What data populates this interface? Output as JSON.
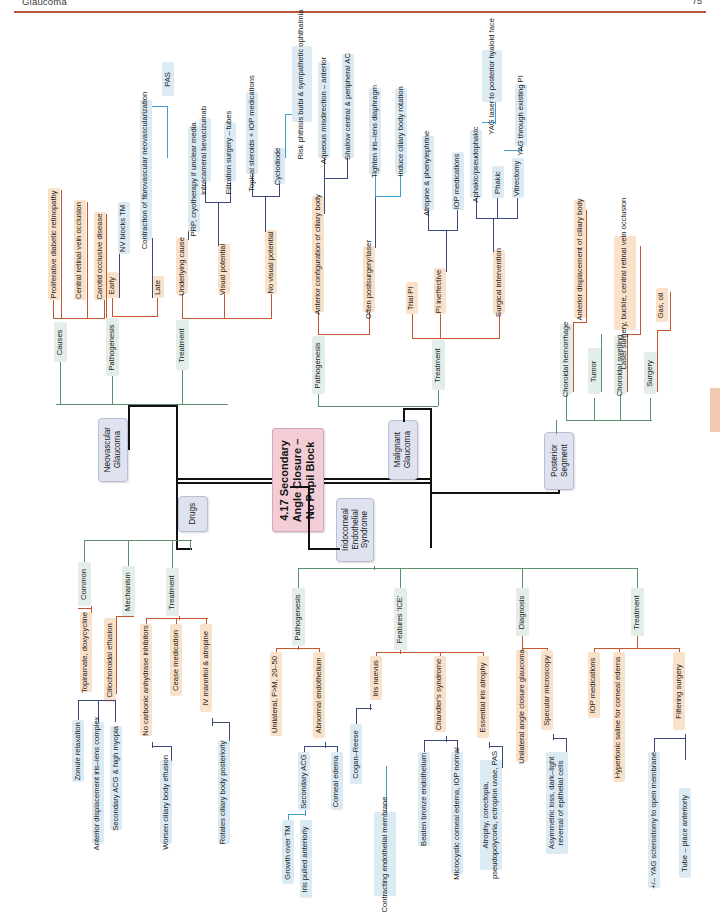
{
  "page": {
    "running_head": "Glaucoma",
    "page_number": "75"
  },
  "colors": {
    "center_fill": "#f3cdd6",
    "main_fill": "#dfe2ef",
    "green_fill": "#e2eee7",
    "orange_fill": "#fae2ca",
    "blue_fill": "#dceaf4",
    "rule": "#b8553c",
    "stroke_black": "#111111",
    "stroke_green": "#5c8f6e",
    "stroke_orange": "#c4552c",
    "stroke_navy": "#3b4a7a",
    "stroke_cyan": "#3e9fd0"
  },
  "center": {
    "title": "4.17 Secondary\nAngle Closure –\nNo Pupil Block"
  },
  "branches": {
    "neovascular": {
      "label": "Neovascular\nGlaucoma",
      "causes": {
        "label": "Causes",
        "items": [
          "Proliferative diabetic retinopathy",
          "Central retinal vein occlusion",
          "Carotid occlusive disease"
        ]
      },
      "pathogenesis": {
        "label": "Pathogenesis",
        "items": [
          {
            "label": "Early",
            "children": [
              "NV blocks TM"
            ]
          },
          {
            "label": "Late",
            "children": [
              "Contraction of fibrovascular neovascularization"
            ],
            "grandchildren": [
              "PAS"
            ]
          }
        ]
      },
      "treatment": {
        "label": "Treatment",
        "items": [
          {
            "label": "Underlying cause",
            "children": [
              "PRP, cryotherapy if unclear media"
            ]
          },
          {
            "label": "Visual potential",
            "children": [
              "Intracameral bevacizumab",
              "Filtration surgery – tubes"
            ]
          },
          {
            "label": "No visual potential",
            "children": [
              "Topical steroids + IOP medications",
              "Cyclodiode"
            ],
            "grandchildren": [
              "Risk phthisis bulbi & sympathetic ophthalmia"
            ]
          }
        ]
      }
    },
    "malignant": {
      "label": "Malignant\nGlaucoma",
      "pathogenesis": {
        "label": "Pathogenesis",
        "items": [
          {
            "label": "Anterior configuration of ciliary body",
            "children": [
              "Aqueous misdirection – anterior",
              "Shallow central & peripheral AC"
            ]
          },
          {
            "label": "Often postsurgery/laser",
            "children": [
              "Tighten iris–lens diaphragm",
              "Induce ciliary body rotation"
            ]
          }
        ]
      },
      "treatment": {
        "label": "Treatment",
        "items": [
          {
            "label": "Trial PI",
            "children": []
          },
          {
            "label": "PI ineffective",
            "children": [
              "Atropine & phenylephrine",
              "IOP medications"
            ]
          },
          {
            "label": "Surgical intervention",
            "children": [
              "Aphakic/pseudophakic",
              "Phakic",
              "Vitrectomy"
            ],
            "grandchildren": [
              "YAG laser to posterior hyaloid face",
              "YAG through existing PI"
            ]
          }
        ]
      }
    },
    "posterior": {
      "label": "Posterior\nSegment",
      "items": [
        {
          "label": "Choroidal hemorrhage",
          "children": [
            "Anterior displacement of ciliary body"
          ]
        },
        {
          "label": "Tumor",
          "children": []
        },
        {
          "label": "Choroidal swelling",
          "children": [
            "Laser surgery, buckle, central retinal vein occlusion"
          ]
        },
        {
          "label": "Surgery",
          "children": [
            "Gas, oil"
          ]
        }
      ]
    },
    "drugs": {
      "label": "Drugs",
      "common": {
        "label": "Common",
        "items": [
          "Topiramate, doxycycline"
        ]
      },
      "mechanism": {
        "label": "Mechanism",
        "items": [
          {
            "label": "Ciliochoroidal effusion",
            "children": [
              "Zonule relaxation",
              "Anterior displacement iris–lens complex",
              "Secondary ACG & high myopia"
            ]
          }
        ]
      },
      "treatment": {
        "label": "Treatment",
        "items": [
          {
            "label": "No carbonic anhydrase inhibitors",
            "children": [
              "Worsen ciliary body effusion"
            ]
          },
          {
            "label": "Cease medication",
            "children": []
          },
          {
            "label": "IV mannitol & atropine",
            "children": [
              "Rotates ciliary body posteriorly"
            ]
          }
        ]
      }
    },
    "ice": {
      "label": "Iridocorneal\nEndothelial\nSyndrome",
      "pathogenesis": {
        "label": "Pathogenesis",
        "items": [
          {
            "label": "Unilateral, F>M, 20–50",
            "children": []
          },
          {
            "label": "Abnormal endothelium",
            "children": [
              "Secondary ACG",
              "Corneal edema"
            ],
            "grandchildren": [
              "Growth over TM",
              "Iris pulled anteriorly",
              "Contracting endothelial membrane"
            ]
          }
        ]
      },
      "features": {
        "label": "Features 'ICE'",
        "items": [
          {
            "label": "Iris naevus",
            "children": [
              "Cogan–Reese"
            ]
          },
          {
            "label": "Chandler's syndrome",
            "children": [
              "Beaten bronze endothelium",
              "Microcystic corneal edema, IOP normal"
            ]
          },
          {
            "label": "Essential iris atrophy",
            "children": [
              "Atrophy, corectopia,\npseudopolycoria, ectropion uvae, PAS"
            ]
          }
        ]
      },
      "diagnosis": {
        "label": "Diagnosis",
        "items": [
          {
            "label": "Unilateral angle closure glaucoma",
            "children": []
          },
          {
            "label": "Specular microscopy",
            "children": [
              "Asymmetric loss, dark–light\nreversal of epithelial cells"
            ]
          }
        ]
      },
      "treatment": {
        "label": "Treatment",
        "items": [
          {
            "label": "IOP medications",
            "children": []
          },
          {
            "label": "Hypertonic saline for corneal edema",
            "children": []
          },
          {
            "label": "Filtering surgery",
            "children": [
              "+/– YAG sclerostomy to open membrane",
              "Tube – place anteriorly"
            ]
          }
        ]
      }
    }
  }
}
